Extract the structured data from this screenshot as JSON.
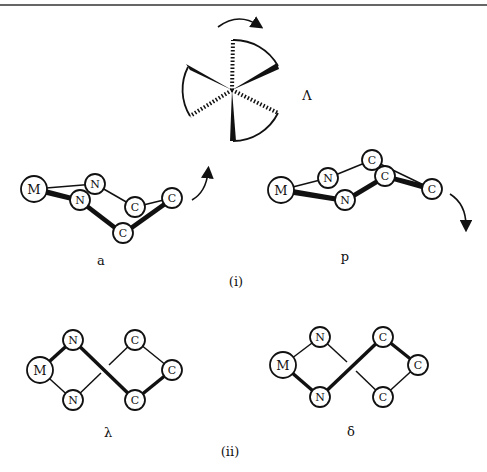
{
  "labels": {
    "conf_a": "a",
    "conf_p": "p",
    "section_i": "(i)",
    "chirality_top": "Λ",
    "conf_lambda": "λ",
    "conf_delta": "δ",
    "section_ii": "(ii)"
  },
  "atoms": {
    "metal": "M",
    "nitrogen": "N",
    "carbon": "C"
  },
  "colors": {
    "ink": "#111111",
    "paper": "#ffffff"
  }
}
